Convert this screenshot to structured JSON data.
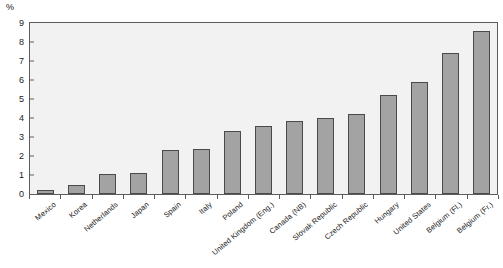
{
  "chart_data": {
    "type": "bar",
    "title": "",
    "subtitle": "",
    "xlabel": "",
    "ylabel": "%",
    "ylim": [
      0,
      9
    ],
    "ytick_labels": [
      "0",
      "1",
      "2",
      "3",
      "4",
      "5",
      "6",
      "7",
      "8",
      "9"
    ],
    "yticks": [
      0,
      1,
      2,
      3,
      4,
      5,
      6,
      7,
      8,
      9
    ],
    "grid": false,
    "legend": "none",
    "categories": [
      "Mexico",
      "Korea",
      "Netherlands",
      "Japan",
      "Spain",
      "Italy",
      "Poland",
      "United Kingdom (Eng.)",
      "Canada (NB)",
      "Slovak Republic",
      "Czech Republic",
      "Hungary",
      "United States",
      "Belgium (Fl.)",
      "Belgium (Fr.)"
    ],
    "values": [
      0.2,
      0.45,
      1.05,
      1.1,
      2.3,
      2.35,
      3.3,
      3.6,
      3.85,
      4.0,
      4.2,
      5.2,
      5.9,
      7.4,
      8.6
    ],
    "series": [
      {
        "name": "",
        "values": [
          0.2,
          0.45,
          1.05,
          1.1,
          2.3,
          2.35,
          3.3,
          3.6,
          3.85,
          4.0,
          4.2,
          5.2,
          5.9,
          7.4,
          8.6
        ]
      }
    ],
    "colors": {
      "bar_fill": "#a3a3a3",
      "bar_edge": "#4a4a4a",
      "plot_background": "#f2f2f2",
      "axis": "#5d5d5d",
      "text": "#1a1a1a"
    }
  }
}
